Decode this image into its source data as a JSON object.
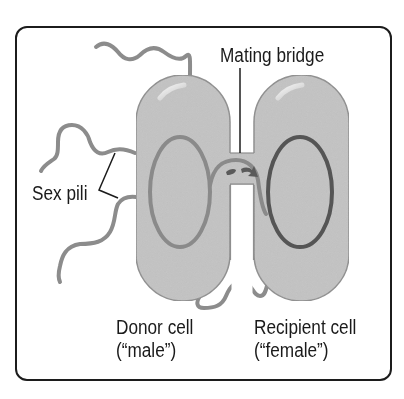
{
  "diagram": {
    "type": "bacterial-conjugation",
    "labels": {
      "mating_bridge": "Mating bridge",
      "sex_pili": "Sex pili",
      "donor_line1": "Donor cell",
      "donor_line2": "(“male”)",
      "recipient_line1": "Recipient cell",
      "recipient_line2": "(“female”)"
    },
    "colors": {
      "frame_border": "#1c1c1c",
      "cell_fill": "#c3c3c3",
      "cell_outline": "#8e8e8e",
      "pili": "#8c8c8c",
      "donor_plasmid": "#8a8a8a",
      "recipient_plasmid": "#555555",
      "transfer_arrow": "#5a5a5a",
      "text": "#1a1a1a"
    }
  }
}
